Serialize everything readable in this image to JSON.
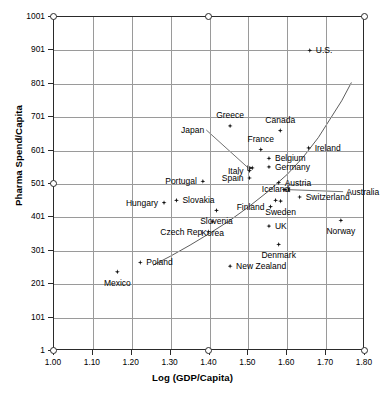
{
  "chart_data": {
    "type": "scatter",
    "title": "",
    "xlabel": "Log (GDP/Capita)",
    "ylabel": "Pharma Spend/Capita",
    "xlim": [
      1.0,
      1.8
    ],
    "ylim": [
      1,
      1001
    ],
    "xticks": [
      "1.00",
      "1.10",
      "1.20",
      "1.30",
      "1.40",
      "1.50",
      "1.60",
      "1.70",
      "1.80"
    ],
    "xtick_values": [
      1.0,
      1.1,
      1.2,
      1.3,
      1.4,
      1.5,
      1.6,
      1.7,
      1.8
    ],
    "yticks": [
      "1",
      "101",
      "201",
      "301",
      "401",
      "501",
      "601",
      "701",
      "801",
      "901",
      "1001"
    ],
    "ytick_values": [
      1,
      101,
      201,
      301,
      401,
      501,
      601,
      701,
      801,
      901,
      1001
    ],
    "grid": true,
    "legend": "none",
    "marker": "diamond",
    "marker_color": "#111111",
    "grid_color": "#9a9a9a",
    "axis_color": "#2a2a2a",
    "trendline": {
      "present": true,
      "style": "solid-thin",
      "points": [
        [
          1.255,
          258
        ],
        [
          1.3,
          285
        ],
        [
          1.35,
          318
        ],
        [
          1.4,
          353
        ],
        [
          1.45,
          390
        ],
        [
          1.5,
          432
        ],
        [
          1.55,
          478
        ],
        [
          1.6,
          530
        ],
        [
          1.64,
          580
        ],
        [
          1.68,
          640
        ],
        [
          1.71,
          695
        ],
        [
          1.74,
          750
        ],
        [
          1.765,
          805
        ]
      ]
    },
    "points": [
      {
        "name": "U.S.",
        "x": 1.658,
        "y": 901,
        "label_pos": "r"
      },
      {
        "name": "Greece",
        "x": 1.453,
        "y": 675,
        "label_pos": "t"
      },
      {
        "name": "Canada",
        "x": 1.582,
        "y": 661,
        "label_pos": "t"
      },
      {
        "name": "Ireland",
        "x": 1.655,
        "y": 609,
        "label_pos": "r"
      },
      {
        "name": "France",
        "x": 1.532,
        "y": 604,
        "label_pos": "t"
      },
      {
        "name": "Belgium",
        "x": 1.553,
        "y": 578,
        "label_pos": "r"
      },
      {
        "name": "Germany",
        "x": 1.553,
        "y": 552,
        "label_pos": "r"
      },
      {
        "name": "Japan",
        "x": 1.51,
        "y": 549,
        "label_pos": "leader"
      },
      {
        "name": "Italy",
        "x": 1.503,
        "y": 541,
        "label_pos": "l"
      },
      {
        "name": "Spain",
        "x": 1.503,
        "y": 519,
        "label_pos": "l"
      },
      {
        "name": "Portugal",
        "x": 1.383,
        "y": 509,
        "label_pos": "l"
      },
      {
        "name": "Austria",
        "x": 1.578,
        "y": 505,
        "label_pos": "r"
      },
      {
        "name": "Australia",
        "x": 1.592,
        "y": 484,
        "label_pos": "leader"
      },
      {
        "name": "Switzerland",
        "x": 1.632,
        "y": 462,
        "label_pos": "r"
      },
      {
        "name": "Iceland",
        "x": 1.57,
        "y": 452,
        "label_pos": "t"
      },
      {
        "name": "Sweden",
        "x": 1.583,
        "y": 450,
        "label_pos": "b"
      },
      {
        "name": "Slovakia",
        "x": 1.315,
        "y": 452,
        "label_pos": "r"
      },
      {
        "name": "Hungary",
        "x": 1.283,
        "y": 445,
        "label_pos": "l"
      },
      {
        "name": "Finland",
        "x": 1.557,
        "y": 433,
        "label_pos": "l"
      },
      {
        "name": "Slovenia",
        "x": 1.418,
        "y": 422,
        "label_pos": "b"
      },
      {
        "name": "Norway",
        "x": 1.738,
        "y": 392,
        "label_pos": "b"
      },
      {
        "name": "Korea",
        "x": 1.408,
        "y": 388,
        "label_pos": "b"
      },
      {
        "name": "UK",
        "x": 1.553,
        "y": 375,
        "label_pos": "r"
      },
      {
        "name": "Czech Rep",
        "x": 1.397,
        "y": 358,
        "label_pos": "l"
      },
      {
        "name": "Denmark",
        "x": 1.578,
        "y": 320,
        "label_pos": "b"
      },
      {
        "name": "Poland",
        "x": 1.222,
        "y": 266,
        "label_pos": "r"
      },
      {
        "name": "New Zealand",
        "x": 1.453,
        "y": 255,
        "label_pos": "r"
      },
      {
        "name": "Mexico",
        "x": 1.163,
        "y": 238,
        "label_pos": "b"
      }
    ]
  }
}
